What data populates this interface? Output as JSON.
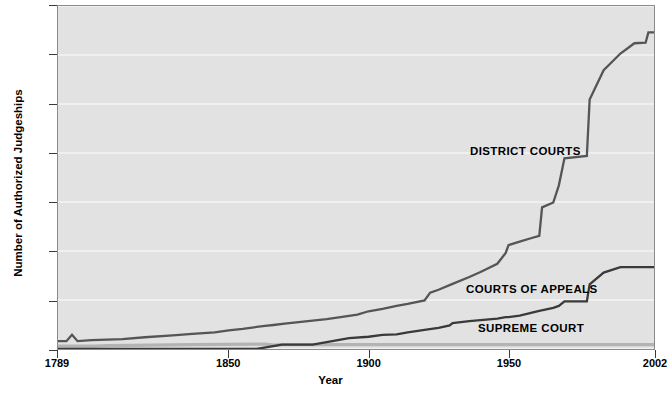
{
  "chart_data": {
    "type": "line",
    "title": "",
    "xlabel": "Year",
    "ylabel": "Number of Authorized Judgeships",
    "xlim": [
      1789,
      2002
    ],
    "ylim": [
      0,
      700
    ],
    "grid": true,
    "legend_position": "inline-annotations",
    "x_ticks": [
      "1789",
      "1850",
      "1900",
      "1950",
      "2002"
    ],
    "x_tick_values": [
      1789,
      1850,
      1900,
      1950,
      2002
    ],
    "y_ticks": [
      "0",
      "100",
      "200",
      "300",
      "400",
      "500",
      "600",
      "700"
    ],
    "y_tick_values": [
      0,
      100,
      200,
      300,
      400,
      500,
      600,
      700
    ],
    "series": [
      {
        "name": "DISTRICT COURTS",
        "color": "#555555",
        "label_x": 1931,
        "label_y": 405,
        "points": [
          [
            1789,
            16
          ],
          [
            1792,
            16
          ],
          [
            1794,
            29
          ],
          [
            1796,
            16
          ],
          [
            1801,
            18
          ],
          [
            1812,
            20
          ],
          [
            1820,
            24
          ],
          [
            1830,
            28
          ],
          [
            1837,
            31
          ],
          [
            1845,
            34
          ],
          [
            1850,
            38
          ],
          [
            1855,
            41
          ],
          [
            1860,
            45
          ],
          [
            1863,
            47
          ],
          [
            1866,
            49
          ],
          [
            1870,
            52
          ],
          [
            1875,
            55
          ],
          [
            1880,
            58
          ],
          [
            1885,
            61
          ],
          [
            1890,
            65
          ],
          [
            1896,
            70
          ],
          [
            1900,
            77
          ],
          [
            1905,
            82
          ],
          [
            1910,
            88
          ],
          [
            1914,
            92
          ],
          [
            1920,
            99
          ],
          [
            1922,
            115
          ],
          [
            1925,
            121
          ],
          [
            1930,
            133
          ],
          [
            1936,
            147
          ],
          [
            1940,
            157
          ],
          [
            1946,
            174
          ],
          [
            1949,
            196
          ],
          [
            1950,
            212
          ],
          [
            1954,
            219
          ],
          [
            1958,
            226
          ],
          [
            1961,
            231
          ],
          [
            1962,
            289
          ],
          [
            1966,
            299
          ],
          [
            1968,
            334
          ],
          [
            1970,
            389
          ],
          [
            1978,
            394
          ],
          [
            1979,
            509
          ],
          [
            1984,
            569
          ],
          [
            1990,
            603
          ],
          [
            1995,
            624
          ],
          [
            1999,
            625
          ],
          [
            2000,
            646
          ],
          [
            2002,
            646
          ]
        ]
      },
      {
        "name": "COURTS OF APPEALS",
        "color": "#3a3a3a",
        "label_x": 1928,
        "label_y": 110,
        "points": [
          [
            1789,
            0
          ],
          [
            1860,
            0
          ],
          [
            1869,
            9
          ],
          [
            1880,
            9
          ],
          [
            1890,
            19
          ],
          [
            1893,
            22
          ],
          [
            1900,
            25
          ],
          [
            1905,
            29
          ],
          [
            1910,
            30
          ],
          [
            1911,
            31
          ],
          [
            1914,
            34
          ],
          [
            1920,
            39
          ],
          [
            1925,
            43
          ],
          [
            1929,
            48
          ],
          [
            1930,
            53
          ],
          [
            1936,
            57
          ],
          [
            1938,
            58
          ],
          [
            1940,
            59
          ],
          [
            1946,
            62
          ],
          [
            1949,
            65
          ],
          [
            1950,
            65
          ],
          [
            1954,
            68
          ],
          [
            1961,
            78
          ],
          [
            1966,
            84
          ],
          [
            1968,
            88
          ],
          [
            1970,
            97
          ],
          [
            1978,
            97
          ],
          [
            1979,
            132
          ],
          [
            1984,
            156
          ],
          [
            1990,
            167
          ],
          [
            1995,
            167
          ],
          [
            2002,
            167
          ]
        ]
      },
      {
        "name": "SUPREME COURT",
        "color": "#b3b3b3",
        "label_x": 1933,
        "label_y": 38,
        "points": [
          [
            1789,
            6
          ],
          [
            1801,
            6
          ],
          [
            1802,
            6
          ],
          [
            1807,
            7
          ],
          [
            1837,
            9
          ],
          [
            1863,
            10
          ],
          [
            1866,
            8
          ],
          [
            1869,
            9
          ],
          [
            1900,
            9
          ],
          [
            1950,
            9
          ],
          [
            2002,
            9
          ]
        ]
      }
    ]
  },
  "axis": {
    "y_title": "Number of Authorized Judgeships",
    "x_title": "Year"
  },
  "colors": {
    "plot_background": "#e2e2e2",
    "gridline": "#f4f4f4",
    "frame": "#8a8a8a",
    "district_courts": "#555555",
    "courts_of_appeals": "#3a3a3a",
    "supreme_court": "#b3b3b3"
  }
}
